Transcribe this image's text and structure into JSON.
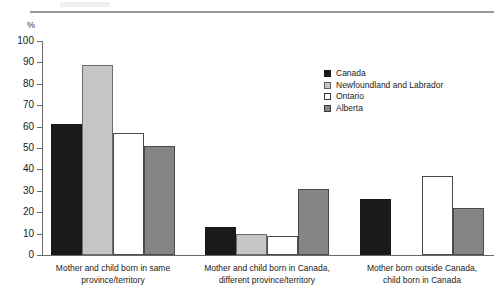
{
  "figure": {
    "unit_label": "%",
    "has_top_rule": true
  },
  "legend": {
    "position": "inside-top-right",
    "entries": [
      {
        "label": "Canada",
        "color": "#1a1a1a",
        "key": "canada"
      },
      {
        "label": "Newfoundland and Labrador",
        "color": "#c6c6c6",
        "key": "nl"
      },
      {
        "label": "Ontario",
        "color": "#ffffff",
        "key": "ontario"
      },
      {
        "label": "Alberta",
        "color": "#858585",
        "key": "alberta"
      }
    ]
  },
  "chart_data": {
    "type": "bar",
    "title": "",
    "subtitle": "",
    "xlabel": "",
    "ylabel": "%",
    "ylim": [
      0,
      100
    ],
    "yticks": [
      0,
      10,
      20,
      30,
      40,
      50,
      60,
      70,
      80,
      90,
      100
    ],
    "ytick_labels": [
      "0",
      "10",
      "20",
      "30",
      "40",
      "50",
      "60",
      "70",
      "80",
      "90",
      "100"
    ],
    "grid": false,
    "legend_position": "inside-top-right",
    "categories": [
      "Mother and child born in same province/territory",
      "Mother and child born in Canada, different province/territory",
      "Mother born outside Canada, child born in Canada"
    ],
    "category_lines": [
      [
        "Mother and child born in same",
        "province/territory"
      ],
      [
        "Mother and child born in Canada,",
        "different province/territory"
      ],
      [
        "Mother born outside Canada,",
        "child born in Canada"
      ]
    ],
    "series": [
      {
        "name": "Canada",
        "color": "#1a1a1a",
        "values": [
          61,
          13,
          26
        ]
      },
      {
        "name": "Newfoundland and Labrador",
        "color": "#c6c6c6",
        "values": [
          89,
          10,
          0
        ]
      },
      {
        "name": "Ontario",
        "color": "#ffffff",
        "values": [
          57,
          9,
          37
        ]
      },
      {
        "name": "Alberta",
        "color": "#858585",
        "values": [
          51,
          31,
          22
        ]
      }
    ]
  }
}
